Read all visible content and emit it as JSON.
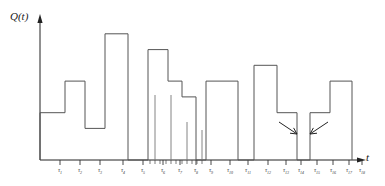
{
  "figure": {
    "ylabel": "Q(t)",
    "xlabel": "t",
    "stroke_color": "#555555",
    "axis_color": "#222222"
  },
  "chart_data": {
    "type": "line",
    "title": "",
    "xlabel": "t",
    "ylabel": "Q(t)",
    "grid": false,
    "legend": null,
    "xlim": [
      0,
      385
    ],
    "ylim": [
      0,
      9
    ],
    "axis_pixels": {
      "x0": 40,
      "x1": 365,
      "ybase": 160,
      "ytop": 18
    },
    "tick_labels": [
      "τ1",
      "τ2",
      "τ3",
      "τ4",
      "τ5",
      "τ6",
      "τ7",
      "τ8",
      "τ9",
      "τ10",
      "τ11",
      "τ12",
      "τ13",
      "τ14",
      "τ15",
      "τ16",
      "τ17",
      "τ18"
    ],
    "tick_x": [
      60,
      80,
      100,
      123,
      143,
      163,
      180,
      196,
      211,
      230,
      248,
      268,
      286,
      301,
      317,
      333,
      349,
      362
    ],
    "minor_tick_x": [
      150,
      155,
      160,
      166,
      171,
      176,
      182,
      187,
      192,
      197,
      202
    ],
    "steps": [
      {
        "x_start": 40,
        "x_end": 65,
        "value": 3
      },
      {
        "x_start": 65,
        "x_end": 85,
        "value": 5
      },
      {
        "x_start": 85,
        "x_end": 105,
        "value": 2
      },
      {
        "x_start": 105,
        "x_end": 128,
        "value": 8
      },
      {
        "x_start": 128,
        "x_end": 148,
        "value": 0
      },
      {
        "x_start": 148,
        "x_end": 168,
        "value": 7
      },
      {
        "x_start": 168,
        "x_end": 182,
        "value": 5
      },
      {
        "x_start": 182,
        "x_end": 196,
        "value": 4
      },
      {
        "x_start": 196,
        "x_end": 206,
        "value": 0
      },
      {
        "x_start": 206,
        "x_end": 238,
        "value": 5
      },
      {
        "x_start": 238,
        "x_end": 254,
        "value": 0
      },
      {
        "x_start": 254,
        "x_end": 277,
        "value": 6
      },
      {
        "x_start": 277,
        "x_end": 297,
        "value": 3
      },
      {
        "x_start": 297,
        "x_end": 310,
        "value": 0
      },
      {
        "x_start": 310,
        "x_end": 330,
        "value": 3
      },
      {
        "x_start": 330,
        "x_end": 352,
        "value": 5
      },
      {
        "x_start": 352,
        "x_end": 352,
        "value": 0
      }
    ],
    "drop_lines": [
      {
        "x": 155,
        "y_top": 95
      },
      {
        "x": 171,
        "y_top": 95
      },
      {
        "x": 187,
        "y_top": 122
      },
      {
        "x": 202,
        "y_top": 130
      }
    ],
    "annotations": [
      {
        "kind": "arrow",
        "points_to_x": 297,
        "label": ""
      },
      {
        "kind": "arrow",
        "points_to_x": 310,
        "label": ""
      }
    ]
  }
}
